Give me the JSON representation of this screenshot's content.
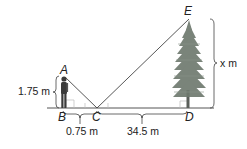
{
  "diagram": {
    "type": "similar-triangles-mirror",
    "points": {
      "A": "A",
      "B": "B",
      "C": "C",
      "D": "D",
      "E": "E"
    },
    "measurements": {
      "person_height": "1.75 m",
      "BC": "0.75 m",
      "CD": "34.5 m",
      "tree_height": "x m"
    },
    "colors": {
      "line": "#444444",
      "tree": "#6f7a6f",
      "trunk": "#5a5f5a",
      "person": "#3a3a3a",
      "label": "#222222"
    }
  }
}
